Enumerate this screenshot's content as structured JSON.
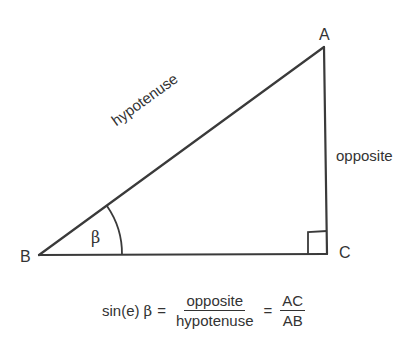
{
  "diagram": {
    "vertices": {
      "A": {
        "label": "A",
        "x": 324,
        "y": 47
      },
      "B": {
        "label": "B",
        "x": 38,
        "y": 255
      },
      "C": {
        "label": "C",
        "x": 327,
        "y": 254
      }
    },
    "sides": {
      "hypotenuse": "hypotenuse",
      "opposite": "opposite"
    },
    "angle": {
      "symbol": "β",
      "at_vertex": "B"
    },
    "right_angle_at": "C",
    "colors": {
      "line": "#3a3a3a",
      "text": "#333333",
      "background": "#ffffff"
    }
  },
  "formula": {
    "lhs_func": "sin(e)",
    "lhs_symbol": "β",
    "equals": "=",
    "frac1_num": "opposite",
    "frac1_den": "hypotenuse",
    "frac2_num": "AC",
    "frac2_den": "AB"
  }
}
